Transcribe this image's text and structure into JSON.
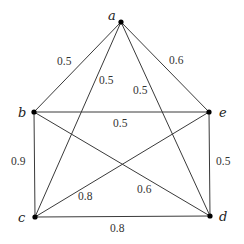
{
  "diagram": {
    "type": "weighted-complete-graph",
    "vertices": [
      {
        "id": "a",
        "label": "a",
        "x": 121,
        "y": 22,
        "lx": 108,
        "ly": 20
      },
      {
        "id": "b",
        "label": "b",
        "x": 34,
        "y": 112,
        "lx": 18,
        "ly": 117
      },
      {
        "id": "e",
        "label": "e",
        "x": 209,
        "y": 112,
        "lx": 219,
        "ly": 117
      },
      {
        "id": "c",
        "label": "c",
        "x": 35,
        "y": 217,
        "lx": 18,
        "ly": 222
      },
      {
        "id": "d",
        "label": "d",
        "x": 210,
        "y": 216,
        "lx": 219,
        "ly": 221
      }
    ],
    "edges": [
      {
        "from": "a",
        "to": "b",
        "weight": "0.5",
        "lx": 57,
        "ly": 65
      },
      {
        "from": "a",
        "to": "c",
        "weight": "0.5",
        "lx": 99,
        "ly": 84
      },
      {
        "from": "a",
        "to": "d",
        "weight": "0.5",
        "lx": 133,
        "ly": 94
      },
      {
        "from": "a",
        "to": "e",
        "weight": "0.6",
        "lx": 169,
        "ly": 64
      },
      {
        "from": "b",
        "to": "e",
        "weight": "0.5",
        "lx": 113,
        "ly": 127
      },
      {
        "from": "b",
        "to": "c",
        "weight": "0.9",
        "lx": 11,
        "ly": 165
      },
      {
        "from": "b",
        "to": "d",
        "weight": "0.6",
        "lx": 137,
        "ly": 193
      },
      {
        "from": "c",
        "to": "e",
        "weight": "0.8",
        "lx": 78,
        "ly": 200
      },
      {
        "from": "c",
        "to": "d",
        "weight": "0.8",
        "lx": 110,
        "ly": 232
      },
      {
        "from": "e",
        "to": "d",
        "weight": "0.5",
        "lx": 216,
        "ly": 165
      }
    ]
  },
  "colors": {
    "edge": "#3a3a3a",
    "vertex": "#000000",
    "text": "#222222",
    "background": "#ffffff"
  }
}
